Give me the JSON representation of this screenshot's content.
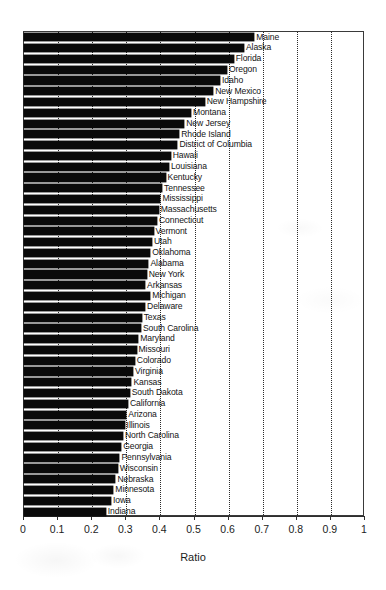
{
  "chart_data": {
    "type": "bar",
    "orientation": "horizontal",
    "title": "",
    "xlabel": "Ratio",
    "ylabel": "",
    "xlim": [
      0,
      1
    ],
    "ylim": null,
    "grid": true,
    "grid_axis": "x",
    "grid_style": "dotted",
    "legend": null,
    "legend_position": "none",
    "bar_color": "#0a0a0a",
    "sorted": "descending",
    "xticks": [
      "0",
      "0.1",
      "0.2",
      "0.3",
      "0.4",
      "0.5",
      "0.6",
      "0.7",
      "0.8",
      "0.9",
      "1"
    ],
    "xtick_values": [
      0,
      0.1,
      0.2,
      0.3,
      0.4,
      0.5,
      0.6,
      0.7,
      0.8,
      0.9,
      1
    ],
    "categories": [
      "Maine",
      "Alaska",
      "Florida",
      "Oregon",
      "Idaho",
      "New Mexico",
      "New Hampshire",
      "Montana",
      "New Jersey",
      "Rhode Island",
      "District of Columbia",
      "Hawaii",
      "Louisiana",
      "Kentucky",
      "Tennessee",
      "Mississippi",
      "Massachusetts",
      "Connecticut",
      "Vermont",
      "Utah",
      "Oklahoma",
      "Alabama",
      "New York",
      "Arkansas",
      "Michigan",
      "Delaware",
      "Texas",
      "South Carolina",
      "Maryland",
      "Missouri",
      "Colorado",
      "Virginia",
      "Kansas",
      "South Dakota",
      "California",
      "Arizona",
      "Illinois",
      "North Carolina",
      "Georgia",
      "Pennsylvania",
      "Wisconsin",
      "Nebraska",
      "Minnesota",
      "Iowa",
      "Indiana"
    ],
    "values": [
      0.675,
      0.645,
      0.615,
      0.595,
      0.575,
      0.555,
      0.53,
      0.49,
      0.47,
      0.455,
      0.45,
      0.43,
      0.425,
      0.415,
      0.405,
      0.4,
      0.395,
      0.39,
      0.38,
      0.375,
      0.37,
      0.365,
      0.36,
      0.355,
      0.37,
      0.355,
      0.345,
      0.343,
      0.335,
      0.33,
      0.325,
      0.32,
      0.315,
      0.31,
      0.305,
      0.3,
      0.295,
      0.29,
      0.285,
      0.28,
      0.275,
      0.268,
      0.262,
      0.255,
      0.24
    ]
  },
  "axis": {
    "x_title": "Ratio"
  }
}
